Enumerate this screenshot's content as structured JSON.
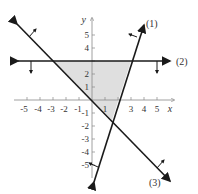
{
  "diagram": {
    "type": "system-of-linear-inequalities",
    "axes": {
      "x_label": "x",
      "y_label": "y",
      "x_ticks": [
        "-5",
        "-4",
        "-3",
        "-2",
        "-1",
        "1",
        "3",
        "4",
        "5"
      ],
      "y_ticks": [
        "5",
        "4",
        "2",
        "1",
        "-1",
        "-2",
        "-3",
        "-4",
        "-5"
      ]
    },
    "lines": [
      {
        "label": "(1)",
        "equation": "y = 3x - 6",
        "shade": "left/above"
      },
      {
        "label": "(2)",
        "equation": "y = 3",
        "shade": "below"
      },
      {
        "label": "(3)",
        "equation": "y = -x",
        "shade": "right/above"
      }
    ],
    "feasible_region": {
      "vertices": [
        [
          -3,
          3
        ],
        [
          3,
          3
        ],
        [
          1.5,
          -1.5
        ]
      ],
      "fill_color": "#d9d9d9"
    },
    "colors": {
      "line": "#1a1a1a",
      "axis": "#888888",
      "region": "#d9d9d9"
    }
  }
}
